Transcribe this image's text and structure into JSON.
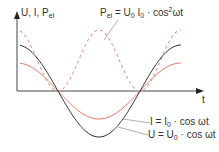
{
  "diagram": {
    "y_axis_label": {
      "main": "U, I, P",
      "sub": "el"
    },
    "x_axis_label": "t",
    "power_formula": {
      "lhs": "P",
      "lhs_sub": "el",
      "eq": " = U",
      "u_sub": "0",
      "i": " I",
      "i_sub": "0",
      "rest": " · cos",
      "sup": "2",
      "tail": "ωt"
    },
    "current_formula": {
      "lhs": "I = I",
      "sub": "0",
      "rest": " · cos ωt"
    },
    "voltage_formula": {
      "lhs": "U = U",
      "sub": "0",
      "rest": " · cos ωt"
    },
    "colors": {
      "voltage": "#333333",
      "current": "#e0806a",
      "power": "#e8a09a",
      "axis": "#333333",
      "leader": "#999999"
    }
  }
}
